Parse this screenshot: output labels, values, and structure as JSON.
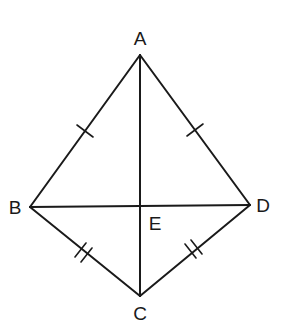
{
  "diagram": {
    "type": "kite geometry figure",
    "points": {
      "A": {
        "label": "A",
        "x": 140,
        "y": 55
      },
      "B": {
        "label": "B",
        "x": 30,
        "y": 207
      },
      "C": {
        "label": "C",
        "x": 140,
        "y": 296
      },
      "D": {
        "label": "D",
        "x": 250,
        "y": 205
      },
      "E": {
        "label": "E",
        "x": 140,
        "y": 206
      }
    },
    "segments": [
      {
        "from": "A",
        "to": "B",
        "tick_marks": 1
      },
      {
        "from": "A",
        "to": "D",
        "tick_marks": 1
      },
      {
        "from": "B",
        "to": "C",
        "tick_marks": 2
      },
      {
        "from": "D",
        "to": "C",
        "tick_marks": 2
      },
      {
        "from": "A",
        "to": "C",
        "tick_marks": 0
      },
      {
        "from": "B",
        "to": "D",
        "tick_marks": 0
      }
    ],
    "labels": {
      "A": "A",
      "B": "B",
      "C": "C",
      "D": "D",
      "E": "E"
    },
    "colors": {
      "line": "#1a1a1a",
      "background": "#ffffff"
    }
  }
}
